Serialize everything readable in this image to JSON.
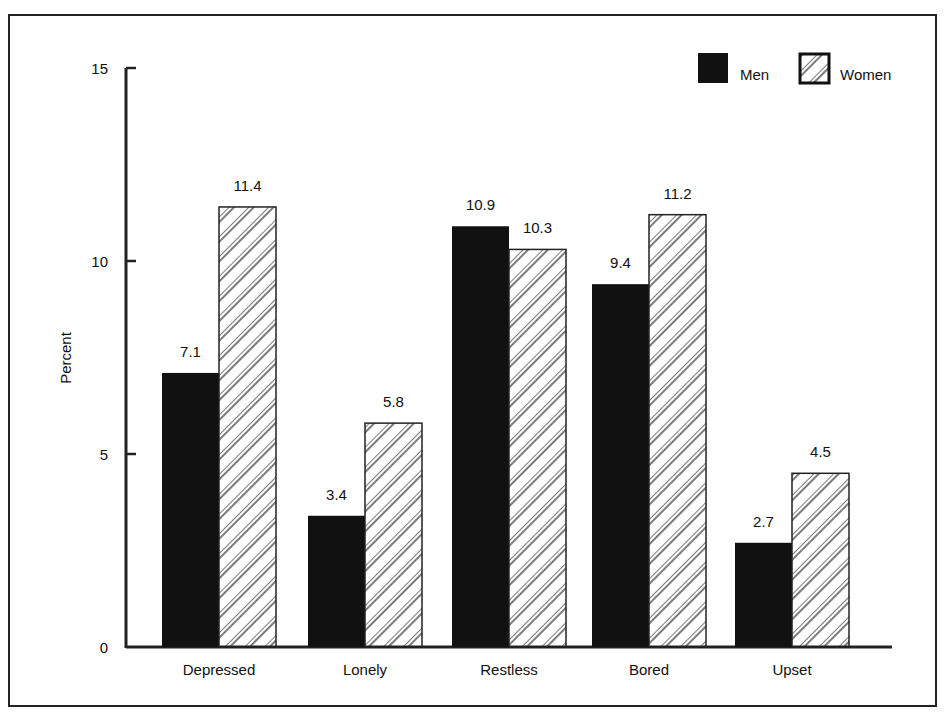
{
  "chart_data": {
    "type": "bar",
    "title": "",
    "xlabel": "",
    "ylabel": "Percent",
    "ylim": [
      0,
      15
    ],
    "yticks": [
      0,
      5,
      10,
      15
    ],
    "grid": false,
    "legend_position": "top-right",
    "categories": [
      "Depressed",
      "Lonely",
      "Restless",
      "Bored",
      "Upset"
    ],
    "series": [
      {
        "name": "Men",
        "style": "solid-black",
        "values": [
          7.1,
          3.4,
          10.9,
          9.4,
          2.7
        ]
      },
      {
        "name": "Women",
        "style": "diagonal-hatch",
        "values": [
          11.4,
          5.8,
          10.3,
          11.2,
          4.5
        ]
      }
    ],
    "value_labels": {
      "Men": [
        "7.1",
        "3.4",
        "10.9",
        "9.4",
        "2.7"
      ],
      "Women": [
        "11.4",
        "5.8",
        "10.3",
        "11.2",
        "4.5"
      ]
    }
  },
  "colors": {
    "men": "#111111",
    "women_fill": "#ffffff",
    "hatch": "#222222",
    "axis": "#222222"
  }
}
